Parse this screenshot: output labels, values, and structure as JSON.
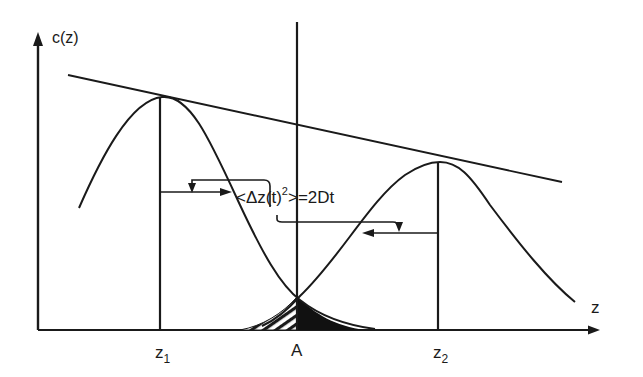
{
  "diagram": {
    "y_axis_label": "c(z)",
    "x_axis_label": "z",
    "markers": {
      "z1": {
        "base": "z",
        "sub": "1"
      },
      "a": "A",
      "z2": {
        "base": "z",
        "sub": "2"
      }
    },
    "equation": {
      "prefix": "<Δz(t)",
      "superscript": "2",
      "suffix": ">=2Dt"
    },
    "elements": [
      "y-axis with arrow",
      "x-axis with arrow",
      "tangent envelope line through both peaks",
      "left gaussian peak at z1",
      "right gaussian peak at z2",
      "vertical line at A",
      "hatched overlap area left of A",
      "solid black overlap area right of A",
      "spread arrows from z1 and z2 linked to equation"
    ],
    "colors": {
      "ink": "#1a1a1a",
      "background": "#ffffff"
    }
  }
}
